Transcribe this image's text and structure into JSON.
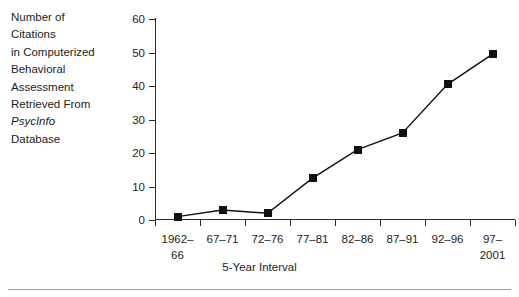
{
  "chart_data": {
    "type": "line",
    "title": "",
    "ylabel": "Number of Citations in Computerized Behavioral Assessment Retrieved From PsycInfo Database",
    "xlabel": "5-Year Interval",
    "categories": [
      "1962–\n66",
      "67–71",
      "72–76",
      "77–81",
      "82–86",
      "87–91",
      "92–96",
      "97–\n2001"
    ],
    "values": [
      1,
      3,
      2,
      12.5,
      21,
      26,
      40.5,
      49.5
    ],
    "ylim": [
      0,
      60
    ],
    "yticks": [
      0,
      10,
      20,
      30,
      40,
      50,
      60
    ],
    "ytick_labels": [
      "0",
      "10",
      "20",
      "30",
      "40",
      "50",
      "60"
    ],
    "grid": false,
    "legend": "none",
    "marker": "square",
    "series_color": "#111111"
  },
  "ylabel_lines": [
    {
      "text": "Number of",
      "italic": false
    },
    {
      "text": "Citations",
      "italic": false
    },
    {
      "text": "in Computerized",
      "italic": false
    },
    {
      "text": "Behavioral",
      "italic": false
    },
    {
      "text": "Assessment",
      "italic": false
    },
    {
      "text": "Retrieved From",
      "italic": false
    },
    {
      "text": "PsycInfo",
      "italic": true
    },
    {
      "text": "Database",
      "italic": false
    }
  ],
  "axis": {
    "x_title": "5-Year Interval"
  },
  "colors": {
    "axis": "#2b2b2b",
    "text": "#1d1d1d",
    "series": "#111111",
    "rule": "#9a9a9a",
    "background": "#ffffff"
  }
}
